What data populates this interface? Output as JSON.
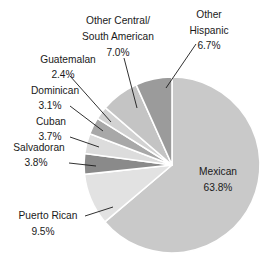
{
  "chart_data": {
    "type": "pie",
    "title": "",
    "subtitle": "",
    "xlabel": "",
    "ylabel": "",
    "legend_position": "none",
    "grid": false,
    "start_angle_deg": 0,
    "direction": "clockwise",
    "categories": [
      "Mexican",
      "Puerto Rican",
      "Salvadoran",
      "Cuban",
      "Dominican",
      "Guatemalan",
      "Other Central/ South American",
      "Other Hispanic"
    ],
    "values": [
      63.8,
      9.5,
      3.8,
      3.7,
      3.1,
      2.4,
      7.0,
      6.7
    ],
    "value_labels": [
      "63.8%",
      "9.5%",
      "3.8%",
      "3.7%",
      "3.1%",
      "2.4%",
      "7.0%",
      "6.7%"
    ],
    "colors": [
      "#c9c9c9",
      "#e2e2e2",
      "#8a8a8a",
      "#dcdcdc",
      "#a8a8a8",
      "#d2d2d2",
      "#c4c4c4",
      "#9b9b9b"
    ],
    "slice_border_color": "#ffffff"
  },
  "slices": {
    "mexican": {
      "label": "Mexican",
      "pct": "63.8%",
      "value": 63.8,
      "color": "#c9c9c9"
    },
    "puerto_rican": {
      "label": "Puerto Rican",
      "pct": "9.5%",
      "value": 9.5,
      "color": "#e2e2e2"
    },
    "salvadoran": {
      "label": "Salvadoran",
      "pct": "3.8%",
      "value": 3.8,
      "color": "#8a8a8a"
    },
    "cuban": {
      "label": "Cuban",
      "pct": "3.7%",
      "value": 3.7,
      "color": "#dcdcdc"
    },
    "dominican": {
      "label": "Dominican",
      "pct": "3.1%",
      "value": 3.1,
      "color": "#a8a8a8"
    },
    "guatemalan": {
      "label": "Guatemalan",
      "pct": "2.4%",
      "value": 2.4,
      "color": "#d2d2d2"
    },
    "other_central_south": {
      "label_line1": "Other Central/",
      "label_line2": "South American",
      "pct": "7.0%",
      "value": 7.0,
      "color": "#c4c4c4"
    },
    "other_hispanic": {
      "label_line1": "Other",
      "label_line2": "Hispanic",
      "pct": "6.7%",
      "value": 6.7,
      "color": "#9b9b9b"
    }
  }
}
